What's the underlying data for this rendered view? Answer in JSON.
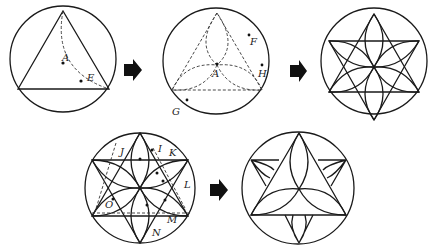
{
  "figure": {
    "panels": [
      {
        "id": "step1",
        "description": "Circle with inscribed triangle and dashed arc through A and E",
        "labels": [
          "A",
          "E"
        ]
      },
      {
        "id": "step2",
        "description": "Circle with dashed triangle and three dashed lens arcs meeting at A",
        "labels": [
          "F",
          "A",
          "H",
          "G"
        ]
      },
      {
        "id": "step3",
        "description": "Hexagram with six-petal rosette inside circle",
        "labels": []
      },
      {
        "id": "step4",
        "description": "Hexagram with rosette and dashed construction lines",
        "labels": [
          "J",
          "I",
          "K",
          "L",
          "O",
          "M",
          "N"
        ]
      },
      {
        "id": "step5",
        "description": "Final triangle with curved petals inside circle",
        "labels": []
      }
    ],
    "labels": {
      "A1": "A",
      "E": "E",
      "F": "F",
      "A2": "A",
      "H": "H",
      "G": "G",
      "J": "J",
      "I": "I",
      "K": "K",
      "L": "L",
      "O": "O",
      "M": "M",
      "N": "N"
    },
    "arrows": [
      "arrow-right",
      "arrow-right",
      "arrow-right"
    ],
    "colors": {
      "stroke": "#1a1a1a",
      "background": "#ffffff"
    }
  }
}
